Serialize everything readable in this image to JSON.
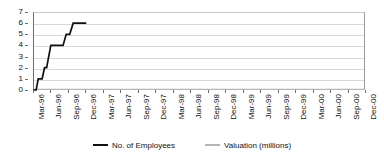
{
  "chart_data": {
    "type": "line",
    "title": "",
    "xlabel": "",
    "ylabel": "",
    "ylim": [
      0,
      7
    ],
    "ytick_values": [
      0,
      1,
      2,
      3,
      4,
      5,
      6,
      7
    ],
    "ytick_labels": [
      "0",
      "1",
      "2",
      "3",
      "4",
      "5",
      "6",
      "7"
    ],
    "grid": true,
    "legend_position": "bottom",
    "categories": [
      "Mar-96",
      "Jun-96",
      "Sep-96",
      "Dec-96",
      "Mar-97",
      "Jun-97",
      "Sep-97",
      "Dec-97",
      "Mar-98",
      "Jun-98",
      "Sep-98",
      "Dec-98",
      "Mar-99",
      "Jun-99",
      "Sep-99",
      "Dec-99",
      "Mar-00",
      "Jun-00",
      "Sep-00",
      "Dec-00"
    ],
    "series": [
      {
        "name": "No. of Employees",
        "color": "#111111",
        "values": [
          0,
          2,
          4,
          4,
          6,
          null,
          null,
          null,
          null,
          null,
          null,
          null,
          null,
          null,
          null,
          null,
          null,
          null,
          null,
          null
        ]
      },
      {
        "name": "Valuation (millions)",
        "color": "#b5b5b5",
        "values": [
          0,
          0,
          0,
          0,
          0,
          0,
          0,
          0,
          0,
          0,
          0,
          0,
          0,
          0,
          0,
          0,
          0,
          0,
          0,
          0
        ]
      }
    ],
    "employees_detail_points": [
      {
        "x": 0.0,
        "y": 0
      },
      {
        "x": 0.18,
        "y": 0
      },
      {
        "x": 0.3,
        "y": 1
      },
      {
        "x": 0.52,
        "y": 1
      },
      {
        "x": 0.66,
        "y": 2
      },
      {
        "x": 0.78,
        "y": 2
      },
      {
        "x": 1.02,
        "y": 4
      },
      {
        "x": 1.72,
        "y": 4
      },
      {
        "x": 1.9,
        "y": 5
      },
      {
        "x": 2.1,
        "y": 5
      },
      {
        "x": 2.3,
        "y": 6
      },
      {
        "x": 3.05,
        "y": 6
      }
    ],
    "valuation_detail_points": [
      {
        "x": 0.0,
        "y": 0.05
      },
      {
        "x": 19.0,
        "y": 0.05
      }
    ]
  },
  "legend": {
    "entries": [
      {
        "label": "No. of Employees",
        "color": "#111111"
      },
      {
        "label": "Valuation (millions)",
        "color": "#b5b5b5"
      }
    ]
  },
  "colors": {
    "employees": "#111111",
    "valuation": "#b5b5b5",
    "grid": "#d8d8d8",
    "axis": "#6d6d6d",
    "background": "#ffffff"
  }
}
